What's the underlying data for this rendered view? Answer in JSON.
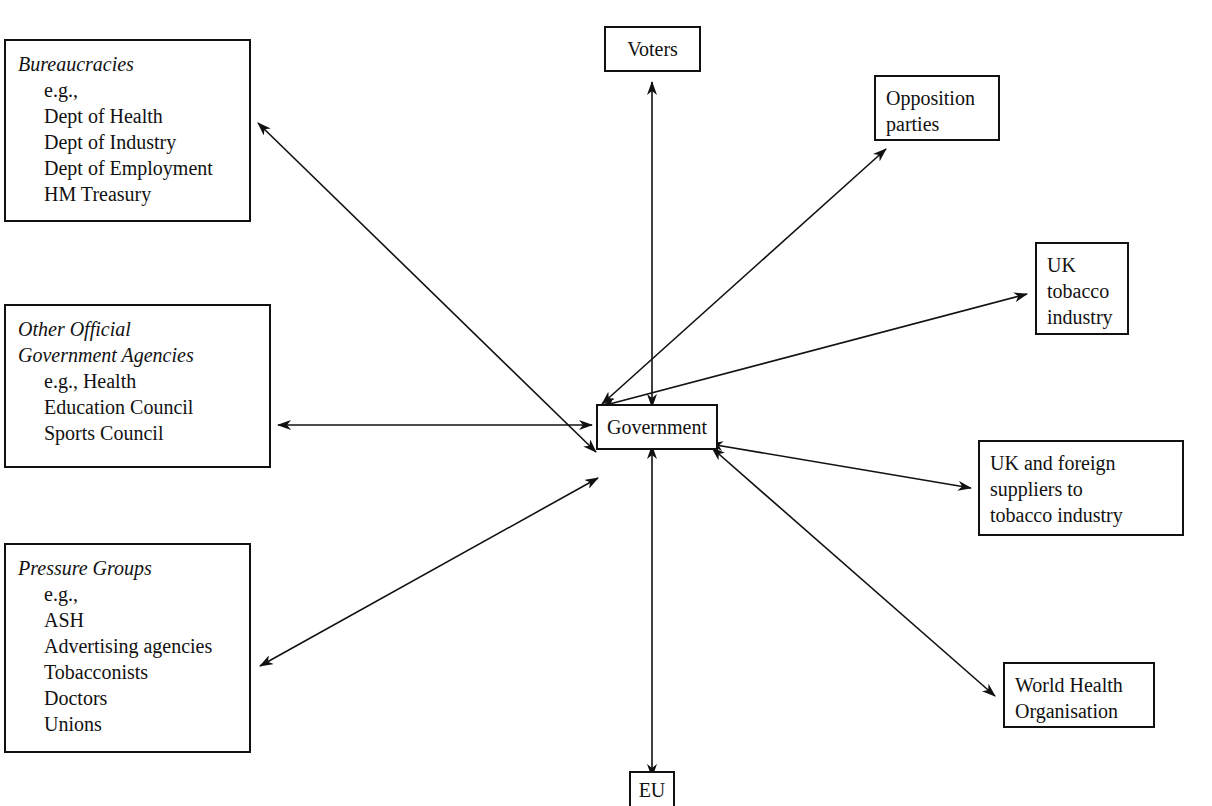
{
  "diagram": {
    "center": {
      "label": "Government"
    },
    "left_boxes": [
      {
        "id": "bureaucracies",
        "title": "Bureaucracies",
        "items": [
          "e.g.,",
          "Dept of Health",
          "Dept of Industry",
          "Dept of Employment",
          "HM Treasury"
        ]
      },
      {
        "id": "other-agencies",
        "title_lines": [
          "Other Official",
          "Government Agencies"
        ],
        "items": [
          "e.g., Health",
          "Education Council",
          "Sports Council"
        ]
      },
      {
        "id": "pressure-groups",
        "title": "Pressure Groups",
        "items": [
          "e.g.,",
          "ASH",
          "Advertising agencies",
          "Tobacconists",
          "Doctors",
          "Unions"
        ]
      }
    ],
    "top_box": {
      "label": "Voters"
    },
    "bottom_box": {
      "label": "EU"
    },
    "right_boxes": [
      {
        "id": "opposition",
        "lines": [
          "Opposition",
          "parties"
        ]
      },
      {
        "id": "uk-tobacco",
        "lines": [
          "UK",
          "tobacco",
          "industry"
        ]
      },
      {
        "id": "suppliers",
        "lines": [
          "UK and foreign",
          "suppliers to",
          "tobacco industry"
        ]
      },
      {
        "id": "who",
        "lines": [
          "World Health",
          "Organisation"
        ]
      }
    ],
    "connections": [
      "Government <-> Bureaucracies",
      "Government <-> Other Official Government Agencies",
      "Government <-> Pressure Groups",
      "Government <-> Voters",
      "Government <-> EU",
      "Government <-> Opposition parties",
      "Government <-> UK tobacco industry",
      "Government <-> UK and foreign suppliers to tobacco industry",
      "Government <-> World Health Organisation"
    ]
  }
}
